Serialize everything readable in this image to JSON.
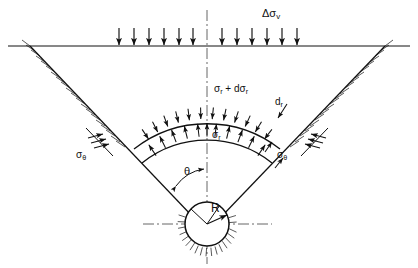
{
  "figure": {
    "type": "engineering-diagram",
    "width": 418,
    "height": 268,
    "background_color": "#ffffff",
    "line_color": "#111111",
    "axis_color": "#555555"
  },
  "labels": {
    "surcharge": {
      "base": "Δσ",
      "sub": "v",
      "x": 262,
      "y": 8
    },
    "radial_outer": {
      "base": "σ",
      "sub": "r",
      "mid": " + dσ",
      "sub2": "r",
      "x": 214,
      "y": 84
    },
    "radial_inner": {
      "base": "σ",
      "sub": "r",
      "x": 212,
      "y": 130
    },
    "element_thickness": {
      "base": "d",
      "sub": "r",
      "x": 275,
      "y": 97
    },
    "hoop_left": {
      "base": "σ",
      "sub": "θ",
      "x": 76,
      "y": 150
    },
    "hoop_right": {
      "base": "σ",
      "sub": "θ",
      "x": 277,
      "y": 150
    },
    "angle_theta": {
      "base": "θ",
      "x": 184,
      "y": 166
    },
    "radius": {
      "base": "R",
      "x": 211,
      "y": 202
    }
  },
  "geometry": {
    "ground_surface_y": 46,
    "centerline_x": 207,
    "wedge_apex": {
      "x": 207,
      "y": 224
    },
    "wedge_left_top": {
      "x": 30,
      "y": 46
    },
    "wedge_right_top": {
      "x": 385,
      "y": 46
    },
    "tunnel_center": {
      "x": 207,
      "y": 224
    },
    "tunnel_radius": 22,
    "arc_outer_radius": 118,
    "arc_inner_radius": 104,
    "half_angle_deg": 38
  },
  "surcharge_arrows": {
    "count": 12,
    "left_count": 6,
    "right_count": 6,
    "x_positions": [
      119,
      134,
      149,
      164,
      179,
      193,
      222,
      237,
      252,
      267,
      282,
      297
    ],
    "y_top": 28,
    "y_bottom": 45
  },
  "arc_arrows": {
    "outer_label": "inward radial pressure sigma_r plus d sigma_r",
    "inner_label": "outward radial pressure sigma_r",
    "outer_count": 13,
    "inner_count": 13
  },
  "hoop_arrows": {
    "left_count": 3,
    "right_count": 3
  },
  "icons": {
    "down-arrow-icon": "↓",
    "hatching-icon": "ground-hatching",
    "centerline-icon": "dash-dot-axis"
  }
}
